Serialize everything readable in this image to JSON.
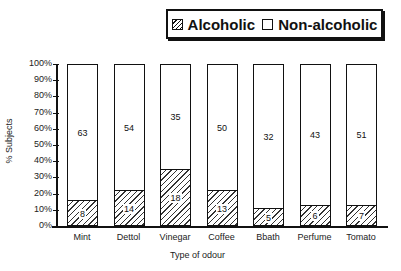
{
  "chart_data": {
    "type": "bar",
    "stacked": true,
    "title": "",
    "xlabel": "Type of odour",
    "ylabel": "% Subjects",
    "ylim": [
      0,
      100
    ],
    "yticks": [
      "0%",
      "10%",
      "20%",
      "30%",
      "40%",
      "50%",
      "60%",
      "70%",
      "80%",
      "90%",
      "100%"
    ],
    "categories": [
      "Mint",
      "Dettol",
      "Vinegar",
      "Coffee",
      "Bbath",
      "Perfume",
      "Tomato"
    ],
    "series": [
      {
        "name": "Alcoholic",
        "values": [
          8,
          14,
          18,
          13,
          5,
          6,
          7
        ],
        "pattern": "hatched"
      },
      {
        "name": "Non-alcoholic",
        "values": [
          63,
          54,
          35,
          50,
          32,
          43,
          51
        ],
        "pattern": "empty"
      }
    ],
    "percent_alcoholic_approx": [
      15,
      21,
      34,
      21,
      10,
      12,
      12
    ],
    "legend": {
      "position": "top-right",
      "entries": [
        "Alcoholic",
        "Non-alcoholic"
      ]
    },
    "grid": false
  }
}
